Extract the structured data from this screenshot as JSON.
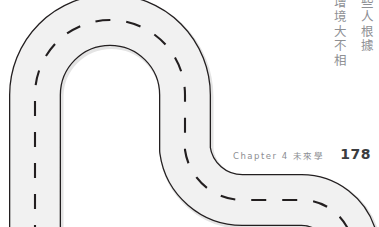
{
  "page": {
    "background_color": "#ffffff",
    "width": 379,
    "height": 227
  },
  "illustration": {
    "name": "winding-road",
    "description": "Light gray winding road with dark outline and dashed white-line center markings, forming a hairpin U-turn at the upper left and an S-curve exiting at the lower right",
    "road_fill_color": "#f0f0f0",
    "road_edge_color": "#231f20",
    "center_dash_color": "#231f20",
    "road_shadow_color": "#e4e4e4"
  },
  "vertical_text": {
    "columns": [
      {
        "id": "col-right",
        "text": "些人根據"
      },
      {
        "id": "col-left",
        "text": "增境大不相"
      }
    ],
    "color": "#8e9094"
  },
  "footer": {
    "chapter_label": "Chapter 4  未來學",
    "page_number": "178",
    "label_color": "#8c8e92",
    "number_color": "#3b3d40"
  }
}
